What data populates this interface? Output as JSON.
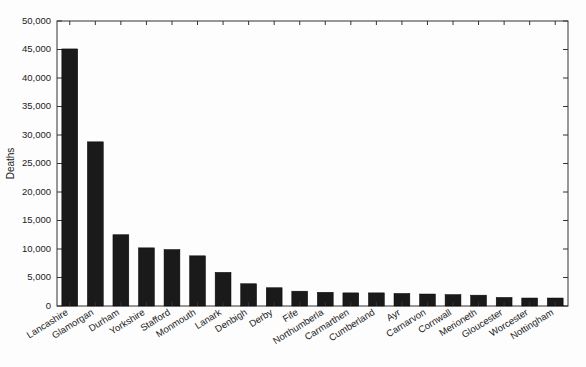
{
  "chart_data": {
    "type": "bar",
    "title": "",
    "subtitle": "",
    "xlabel": "",
    "ylabel": "Deaths",
    "ylim": [
      0,
      50000
    ],
    "grid": false,
    "legend": null,
    "ytick_labels": [
      "0",
      "5,000",
      "10,000",
      "15,000",
      "20,000",
      "25,000",
      "30,000",
      "35,000",
      "40,000",
      "45,000",
      "50,000"
    ],
    "ytick_values": [
      0,
      5000,
      10000,
      15000,
      20000,
      25000,
      30000,
      35000,
      40000,
      45000,
      50000
    ],
    "categories": [
      "Lancashire",
      "Glamorgan",
      "Durham",
      "Yorkshire",
      "Stafford",
      "Monmouth",
      "Lanark",
      "Denbigh",
      "Derby",
      "Fife",
      "Northumberla",
      "Carmarthen",
      "Cumberland",
      "Ayr",
      "Carnarvon",
      "Cornwall",
      "Merioneth",
      "Gloucester",
      "Worcester",
      "Nottingham"
    ],
    "values": [
      45100,
      28800,
      12500,
      10200,
      9900,
      8800,
      5900,
      3900,
      3200,
      2600,
      2400,
      2300,
      2300,
      2200,
      2100,
      2000,
      1900,
      1500,
      1400,
      1400
    ],
    "bar_color": "#1a1a1a",
    "axis_color": "#333333",
    "background_color": "#fdfdfd"
  },
  "labels": {
    "y_axis_title": "Deaths"
  }
}
